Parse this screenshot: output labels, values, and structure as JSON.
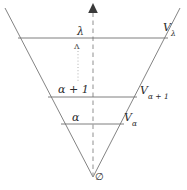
{
  "figure": {
    "background_color": "#ffffff",
    "line_color": "#6f6f6f",
    "axis_color": "#8c8c8c",
    "text_color": "#2b2b2b",
    "width": 187,
    "height": 190
  },
  "axis": {
    "name": "vertical-rank-axis",
    "style": "dashed",
    "arrow": "up",
    "arrow_glyph": "▲",
    "x": 93,
    "top_y": 4,
    "bottom_y": 177
  },
  "cone": {
    "name": "inverted-triangle",
    "apex": {
      "x": 93,
      "y": 177
    },
    "left_top": {
      "x": 5,
      "y": 8
    },
    "right_top": {
      "x": 180,
      "y": 8
    }
  },
  "levels": [
    {
      "id": "level-lambda",
      "ordinal_label": "λ",
      "set_label_base": "V",
      "set_label_subscript": "λ",
      "set_label_full": "Vλ",
      "y": 38,
      "x_left": 18,
      "x_right": 168
    },
    {
      "id": "level-alpha-plus-one",
      "ordinal_label": "α + 1",
      "set_label_base": "V",
      "set_label_subscript": "α + 1",
      "set_label_full": "Vα+1",
      "y": 97,
      "x_left": 48,
      "x_right": 137
    },
    {
      "id": "level-alpha",
      "ordinal_label": "α",
      "set_label_base": "V",
      "set_label_subscript": "α",
      "set_label_full": "Vα",
      "y": 124,
      "x_left": 61,
      "x_right": 124
    }
  ],
  "markers": {
    "caret_glyph": "ʌ",
    "caret_x": 78,
    "caret_y": 46,
    "dotted_continuation": {
      "name": "dotted-continuation-line",
      "x": 78,
      "y_top": 50,
      "y_bottom": 82
    },
    "empty_set_glyph": "∅",
    "empty_set_x": 98,
    "empty_set_y": 178
  }
}
